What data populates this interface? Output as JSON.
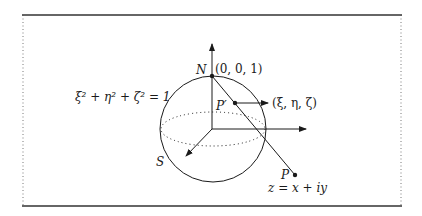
{
  "labels": {
    "north": "N",
    "north_coords": "(0, 0, 1)",
    "sphere_eq": "ξ² + η² + ζ² = 1",
    "p_prime": "P′",
    "p_prime_coords": "(ξ, η, ζ)",
    "south": "S",
    "p": "P",
    "z_eq": "z = x + iy"
  },
  "colors": {
    "stroke": "#1a1a1a",
    "frame": "#333333"
  }
}
